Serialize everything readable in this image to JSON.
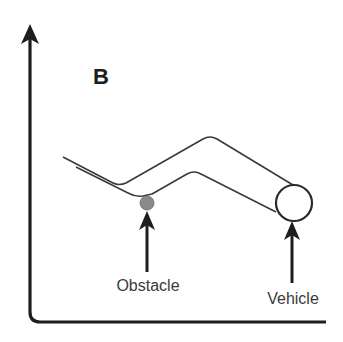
{
  "panel": {
    "letter": "B"
  },
  "labels": {
    "obstacle": "Obstacle",
    "vehicle": "Vehicle"
  },
  "colors": {
    "axis": "#1e1e1e",
    "road_line": "#3a3a3a",
    "obstacle_fill": "#8a8a8a",
    "vehicle_stroke": "#2a2a2a",
    "text": "#3a3a3a",
    "background": "#ffffff"
  },
  "elements": {
    "axes": "L-shaped axes with arrowhead on vertical axis",
    "road": "Two parallel bent lines forming a V then inverted-V path",
    "obstacle": "Gray filled circle at the lower bend of the path",
    "vehicle": "Open circle at the right end of the path"
  }
}
